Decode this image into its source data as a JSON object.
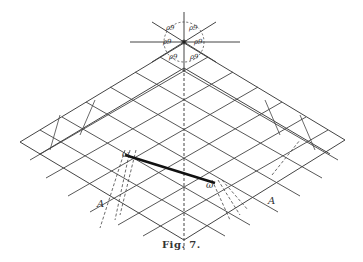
{
  "figure": {
    "caption": "Fig. 7.",
    "star_labels": [
      "ρ9",
      "ρ9",
      "ρ9",
      "ρ9",
      "ρ9",
      "ρ9"
    ],
    "line_labels": {
      "left": "ω",
      "right": "ω"
    },
    "axis_labels": {
      "left": "A",
      "right": "A"
    },
    "colors": {
      "ink": "#333333",
      "background": "#ffffff"
    }
  }
}
